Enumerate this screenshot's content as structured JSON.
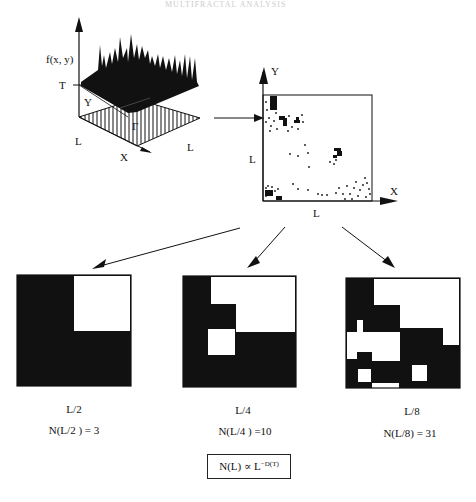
{
  "header": {
    "running_head": "MULTIFRACTAL ANALYSIS"
  },
  "surface_plot": {
    "z_axis_label": "f(x, y)",
    "threshold_label": "T",
    "y_axis_label": "Y",
    "x_axis_label": "X",
    "gamma_label": "Γ",
    "side_left_label": "L",
    "side_right_label": "L"
  },
  "scatter_plot": {
    "y_axis_label": "Y",
    "x_axis_label": "X",
    "side_left_label": "L",
    "side_bottom_label": "L"
  },
  "grids": [
    {
      "scale_label": "L/2",
      "count_label": "N(L/2 ) = 3",
      "cells": 2,
      "count": 3
    },
    {
      "scale_label": "L/4",
      "count_label": "N(L/4 ) =10",
      "cells": 4,
      "count": 10
    },
    {
      "scale_label": "L/8",
      "count_label": "N(L/8) = 31",
      "cells": 8,
      "count": 31
    }
  ],
  "formula": {
    "base": "N(L) ∝ L",
    "exponent": "−D(T)"
  },
  "colors": {
    "ink": "#111111",
    "background": "#ffffff"
  }
}
